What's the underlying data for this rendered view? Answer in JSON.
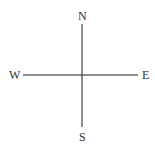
{
  "diagram": {
    "type": "compass",
    "labels": {
      "north": "N",
      "south": "S",
      "east": "E",
      "west": "W"
    },
    "line_color": "#222222",
    "label_color": "#333333"
  }
}
